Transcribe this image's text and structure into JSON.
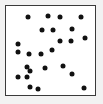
{
  "chart_data": {
    "type": "scatter",
    "title": "",
    "subtitle": "",
    "xlabel": "",
    "ylabel": "",
    "xlim": [
      0,
      100
    ],
    "ylim": [
      0,
      100
    ],
    "grid": false,
    "legend": null,
    "axis_ticks": {
      "x": [],
      "y": []
    },
    "frame": {
      "visible": true,
      "border_color": "#3a3a3a",
      "border_width": 1,
      "background": "#ffffff",
      "outer_background": "#f2f2f2"
    },
    "marker": {
      "shape": "circle",
      "color": "#111111",
      "size_px": 5
    },
    "n_points": 24,
    "series": [
      {
        "name": "points",
        "color": "#111111",
        "points": [
          {
            "x": 24.2,
            "y": 87.9
          },
          {
            "x": 47.3,
            "y": 89.0
          },
          {
            "x": 60.4,
            "y": 87.9
          },
          {
            "x": 84.6,
            "y": 88.0
          },
          {
            "x": 40.7,
            "y": 73.6
          },
          {
            "x": 52.7,
            "y": 72.5
          },
          {
            "x": 74.7,
            "y": 74.7
          },
          {
            "x": 13.2,
            "y": 57.1
          },
          {
            "x": 60.4,
            "y": 60.4
          },
          {
            "x": 72.5,
            "y": 60.4
          },
          {
            "x": 89.0,
            "y": 63.7
          },
          {
            "x": 13.2,
            "y": 48.4
          },
          {
            "x": 25.3,
            "y": 46.2
          },
          {
            "x": 39.6,
            "y": 46.2
          },
          {
            "x": 51.6,
            "y": 50.5
          },
          {
            "x": 23.1,
            "y": 31.9
          },
          {
            "x": 44.0,
            "y": 30.8
          },
          {
            "x": 63.7,
            "y": 33.0
          },
          {
            "x": 13.2,
            "y": 19.8
          },
          {
            "x": 23.1,
            "y": 19.8
          },
          {
            "x": 26.4,
            "y": 27.5
          },
          {
            "x": 74.7,
            "y": 23.1
          },
          {
            "x": 26.4,
            "y": 8.8
          },
          {
            "x": 36.3,
            "y": 6.6
          },
          {
            "x": 87.9,
            "y": 7.7
          }
        ]
      }
    ]
  }
}
